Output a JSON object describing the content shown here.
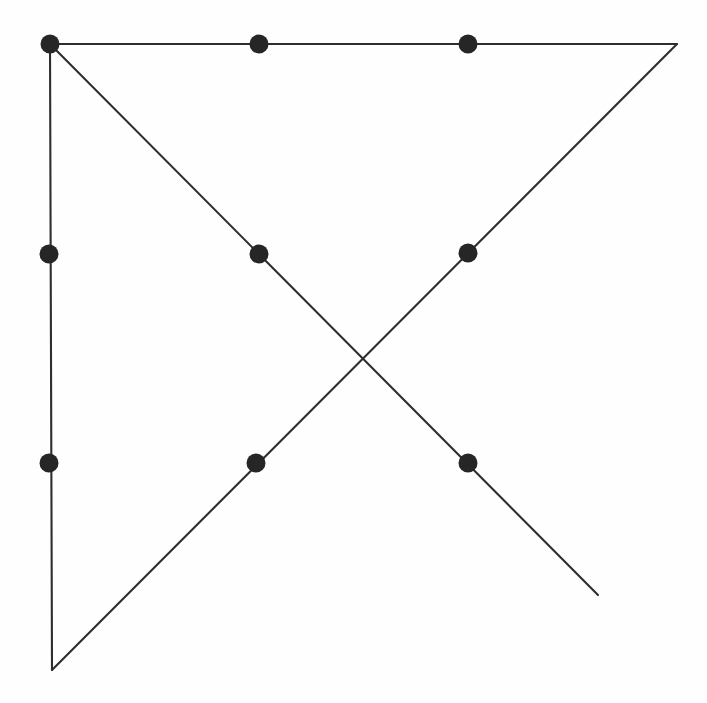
{
  "figure": {
    "background_color": "#fefefe",
    "stroke_color": "#2e2e2e",
    "dot_color": "#262626",
    "stroke_width": 2.1,
    "dot_radius": 9.5,
    "canvas": {
      "width": 707,
      "height": 703
    }
  },
  "chart_data": {
    "type": "scatter",
    "title": "",
    "xlabel": "",
    "ylabel": "",
    "xlim": [
      0,
      707
    ],
    "ylim": [
      703,
      0
    ],
    "grid": false,
    "legend": null,
    "segments": [
      {
        "name": "left-vertical-edge",
        "x1": 50,
        "y1": 44,
        "x2": 52,
        "y2": 670
      },
      {
        "name": "top-horizontal-edge",
        "x1": 50,
        "y1": 44,
        "x2": 677,
        "y2": 44
      },
      {
        "name": "descending-diagonal",
        "x1": 50,
        "y1": 44,
        "x2": 598,
        "y2": 595
      },
      {
        "name": "ascending-diagonal",
        "x1": 52,
        "y1": 670,
        "x2": 677,
        "y2": 44
      }
    ],
    "points": [
      {
        "name": "top-left-corner",
        "x": 50,
        "y": 44
      },
      {
        "name": "top-middle",
        "x": 259,
        "y": 44
      },
      {
        "name": "top-right-inner",
        "x": 468,
        "y": 44
      },
      {
        "name": "mid-left",
        "x": 49,
        "y": 254
      },
      {
        "name": "mid-center-descending",
        "x": 259,
        "y": 254
      },
      {
        "name": "mid-right-ascending",
        "x": 468,
        "y": 253
      },
      {
        "name": "low-left",
        "x": 49,
        "y": 463
      },
      {
        "name": "low-center-ascending",
        "x": 256,
        "y": 463
      },
      {
        "name": "low-right-descending",
        "x": 468,
        "y": 463
      }
    ],
    "unmarked_vertices": [
      {
        "name": "top-right-apex",
        "x": 677,
        "y": 44
      },
      {
        "name": "bottom-left-apex",
        "x": 52,
        "y": 670
      },
      {
        "name": "diagonal-crossing",
        "x": 364,
        "y": 359
      },
      {
        "name": "descending-diagonal-end",
        "x": 598,
        "y": 595
      }
    ]
  }
}
